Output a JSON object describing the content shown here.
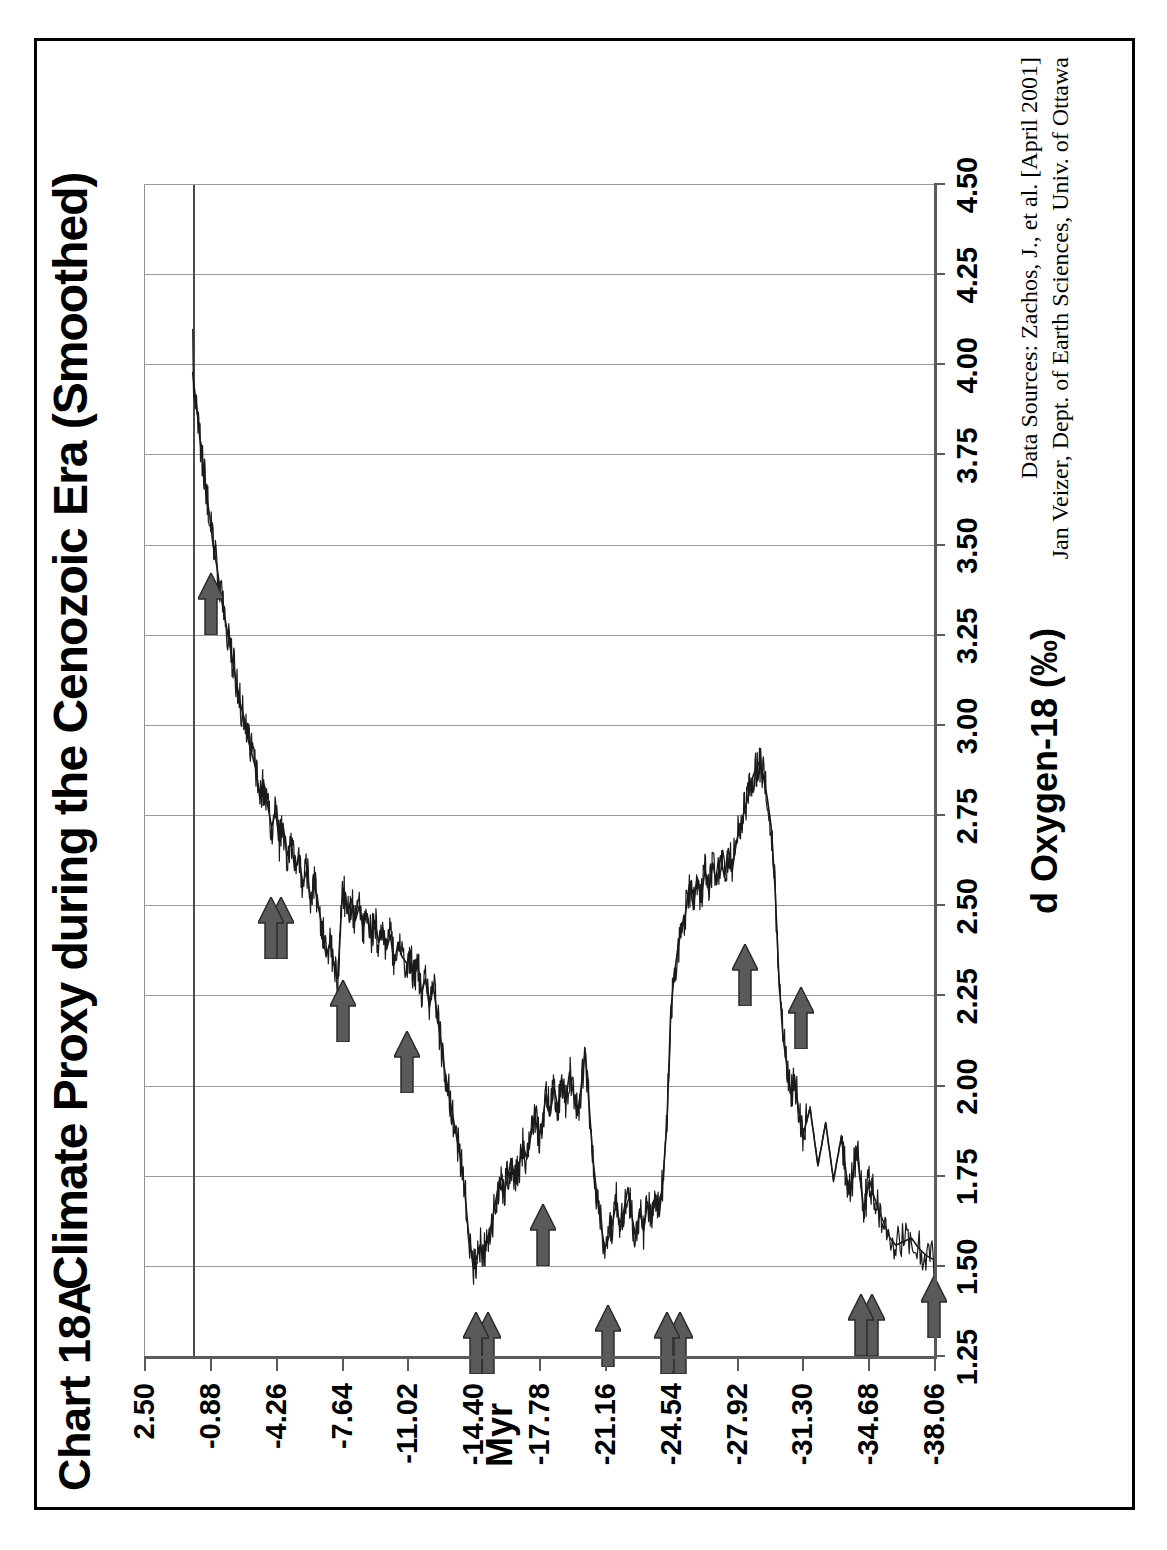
{
  "figure": {
    "number_label": "Chart 18A",
    "title": "Climate Proxy during the Cenozoic Era (Smoothed)"
  },
  "credits": {
    "line1": "Data Sources: Zachos, J., et al. [April 2001]",
    "line2": "Jan Veizer, Dept. of Earth Sciences, Univ. of Ottawa"
  },
  "chart_data": {
    "type": "line",
    "title": "Climate Proxy during the Cenozoic Era (Smoothed)",
    "xlabel": "Myr",
    "ylabel": "d Oxygen-18 (‰)",
    "xlim": [
      -38.06,
      2.5
    ],
    "ylim": [
      1.25,
      4.5
    ],
    "grid": true,
    "legend": "none",
    "orientation": "rotated-90-ccw",
    "xticks": [
      -38.06,
      -34.68,
      -31.3,
      -27.92,
      -24.54,
      -21.16,
      -17.78,
      -14.4,
      -11.02,
      -7.64,
      -4.26,
      -0.88,
      2.5
    ],
    "xtick_labels": [
      "-38.06",
      "-34.68",
      "-31.30",
      "-27.92",
      "-24.54",
      "-21.16",
      "-17.78",
      "-14.40",
      "-11.02",
      "-7.64",
      "-4.26",
      "-0.88",
      "2.50"
    ],
    "yticks": [
      1.25,
      1.5,
      1.75,
      2.0,
      2.25,
      2.5,
      2.75,
      3.0,
      3.25,
      3.5,
      3.75,
      4.0,
      4.25,
      4.5
    ],
    "ytick_labels": [
      "1.25",
      "1.50",
      "1.75",
      "2.00",
      "2.25",
      "2.50",
      "2.75",
      "3.00",
      "3.25",
      "3.50",
      "3.75",
      "4.00",
      "4.25",
      "4.50"
    ],
    "series_name": "d Oxygen-18 smoothed",
    "series_color": "#1a1a1a",
    "note": "Higher d18O (right on value axis) = cooler climate. Data stops near 0 Myr; axis extends to 2.50.",
    "x": [
      -38.06,
      -37.7,
      -37.3,
      -36.9,
      -36.5,
      -36.1,
      -35.8,
      -35.5,
      -35.2,
      -34.95,
      -34.75,
      -34.6,
      -34.45,
      -34.3,
      -34.1,
      -33.9,
      -33.7,
      -33.5,
      -33.3,
      -33.1,
      -32.9,
      -32.7,
      -32.5,
      -32.3,
      -32.1,
      -31.9,
      -31.7,
      -31.5,
      -31.3,
      -31.1,
      -30.9,
      -30.7,
      -30.5,
      -30.3,
      -30.1,
      -29.9,
      -29.7,
      -29.5,
      -29.3,
      -29.1,
      -28.9,
      -28.7,
      -28.5,
      -28.3,
      -28.1,
      -27.92,
      -27.7,
      -27.5,
      -27.3,
      -27.1,
      -26.9,
      -26.7,
      -26.5,
      -26.3,
      -26.1,
      -25.9,
      -25.7,
      -25.5,
      -25.3,
      -25.1,
      -24.9,
      -24.7,
      -24.54,
      -24.35,
      -24.15,
      -23.95,
      -23.75,
      -23.55,
      -23.35,
      -23.15,
      -22.95,
      -22.75,
      -22.55,
      -22.35,
      -22.15,
      -21.95,
      -21.75,
      -21.55,
      -21.35,
      -21.16,
      -20.95,
      -20.75,
      -20.55,
      -20.35,
      -20.15,
      -19.95,
      -19.75,
      -19.55,
      -19.35,
      -19.15,
      -18.95,
      -18.75,
      -18.55,
      -18.35,
      -18.15,
      -17.95,
      -17.78,
      -17.55,
      -17.35,
      -17.15,
      -16.95,
      -16.75,
      -16.55,
      -16.35,
      -16.15,
      -15.95,
      -15.75,
      -15.55,
      -15.35,
      -15.15,
      -14.95,
      -14.75,
      -14.55,
      -14.4,
      -14.15,
      -13.95,
      -13.75,
      -13.55,
      -13.35,
      -13.15,
      -12.95,
      -12.75,
      -12.55,
      -12.35,
      -12.15,
      -11.95,
      -11.75,
      -11.55,
      -11.35,
      -11.15,
      -11.02,
      -10.75,
      -10.55,
      -10.35,
      -10.15,
      -9.95,
      -9.75,
      -9.55,
      -9.35,
      -9.15,
      -8.95,
      -8.75,
      -8.55,
      -8.35,
      -8.15,
      -7.95,
      -7.75,
      -7.64,
      -7.45,
      -7.25,
      -7.05,
      -6.85,
      -6.65,
      -6.45,
      -6.25,
      -6.05,
      -5.85,
      -5.65,
      -5.45,
      -5.25,
      -5.05,
      -4.85,
      -4.65,
      -4.45,
      -4.26,
      -4.05,
      -3.85,
      -3.65,
      -3.45,
      -3.25,
      -3.05,
      -2.85,
      -2.65,
      -2.45,
      -2.25,
      -2.05,
      -1.85,
      -1.65,
      -1.45,
      -1.25,
      -1.05,
      -0.88,
      -0.7,
      -0.55,
      -0.4,
      -0.25,
      -0.12,
      0.0
    ],
    "y": [
      1.52,
      1.53,
      1.55,
      1.58,
      1.57,
      1.56,
      1.58,
      1.62,
      1.66,
      1.7,
      1.74,
      1.7,
      1.66,
      1.73,
      1.82,
      1.76,
      1.7,
      1.78,
      1.86,
      1.8,
      1.74,
      1.82,
      1.9,
      1.84,
      1.78,
      1.86,
      1.94,
      1.9,
      1.86,
      1.94,
      2.02,
      1.98,
      2.06,
      2.14,
      2.3,
      2.55,
      2.72,
      2.8,
      2.86,
      2.9,
      2.88,
      2.85,
      2.8,
      2.76,
      2.72,
      2.68,
      2.6,
      2.66,
      2.58,
      2.64,
      2.56,
      2.62,
      2.54,
      2.6,
      2.52,
      2.58,
      2.5,
      2.56,
      2.48,
      2.44,
      2.38,
      2.3,
      2.2,
      1.9,
      1.75,
      1.64,
      1.7,
      1.62,
      1.68,
      1.6,
      1.66,
      1.58,
      1.64,
      1.72,
      1.66,
      1.6,
      1.68,
      1.62,
      1.58,
      1.55,
      1.62,
      1.7,
      1.8,
      1.95,
      2.1,
      2.0,
      1.92,
      1.98,
      2.04,
      1.96,
      2.02,
      1.94,
      2.0,
      1.92,
      1.98,
      1.9,
      1.86,
      1.92,
      1.86,
      1.8,
      1.84,
      1.78,
      1.74,
      1.8,
      1.74,
      1.7,
      1.74,
      1.68,
      1.62,
      1.58,
      1.54,
      1.56,
      1.52,
      1.5,
      1.6,
      1.72,
      1.8,
      1.86,
      1.92,
      1.98,
      2.04,
      2.12,
      2.2,
      2.28,
      2.22,
      2.3,
      2.26,
      2.34,
      2.3,
      2.38,
      2.34,
      2.36,
      2.4,
      2.34,
      2.42,
      2.38,
      2.44,
      2.4,
      2.46,
      2.42,
      2.48,
      2.44,
      2.5,
      2.46,
      2.52,
      2.48,
      2.54,
      2.5,
      2.3,
      2.34,
      2.4,
      2.36,
      2.44,
      2.5,
      2.56,
      2.52,
      2.6,
      2.56,
      2.64,
      2.6,
      2.68,
      2.64,
      2.72,
      2.68,
      2.76,
      2.72,
      2.78,
      2.84,
      2.8,
      2.88,
      2.92,
      2.96,
      3.02,
      3.06,
      3.12,
      3.18,
      3.24,
      3.3,
      3.36,
      3.44,
      3.5,
      3.58,
      3.64,
      3.72,
      3.78,
      3.86,
      3.92,
      3.98,
      4.04,
      4.08,
      4.1
    ],
    "annotations": [
      {
        "name": "arrow-1",
        "x": -38.06,
        "y": 1.5,
        "points": "right-on-value-axis",
        "count": 1
      },
      {
        "name": "arrow-2a",
        "x": -34.9,
        "y": 1.45,
        "points": "right-on-value-axis",
        "count": 2
      },
      {
        "name": "arrow-2b",
        "x": -34.3,
        "y": 1.45,
        "points": "right-on-value-axis",
        "count": 2
      },
      {
        "name": "arrow-3",
        "x": -31.25,
        "y": 2.3,
        "points": "right-on-value-axis",
        "count": 1
      },
      {
        "name": "arrow-4",
        "x": -28.35,
        "y": 2.42,
        "points": "right-on-value-axis",
        "count": 1
      },
      {
        "name": "arrow-5a",
        "x": -25.0,
        "y": 1.4,
        "points": "right-on-value-axis",
        "count": 2
      },
      {
        "name": "arrow-5b",
        "x": -24.35,
        "y": 1.4,
        "points": "right-on-value-axis",
        "count": 2
      },
      {
        "name": "arrow-6",
        "x": -21.3,
        "y": 1.42,
        "points": "right-on-value-axis",
        "count": 1
      },
      {
        "name": "arrow-7",
        "x": -18.0,
        "y": 1.7,
        "points": "right-on-value-axis",
        "count": 1
      },
      {
        "name": "arrow-8a",
        "x": -15.15,
        "y": 1.4,
        "points": "right-on-value-axis",
        "count": 2
      },
      {
        "name": "arrow-8b",
        "x": -14.55,
        "y": 1.4,
        "points": "right-on-value-axis",
        "count": 2
      },
      {
        "name": "arrow-9",
        "x": -11.0,
        "y": 2.18,
        "points": "right-on-value-axis",
        "count": 1
      },
      {
        "name": "arrow-10",
        "x": -7.7,
        "y": 2.32,
        "points": "right-on-value-axis",
        "count": 1
      },
      {
        "name": "arrow-11a",
        "x": -4.55,
        "y": 2.55,
        "points": "right-on-value-axis",
        "count": 2
      },
      {
        "name": "arrow-11b",
        "x": -4.0,
        "y": 2.55,
        "points": "right-on-value-axis",
        "count": 2
      },
      {
        "name": "arrow-12",
        "x": -0.95,
        "y": 3.45,
        "points": "right-on-value-axis",
        "count": 1
      }
    ],
    "annotation_color": "#5a5a5a"
  }
}
